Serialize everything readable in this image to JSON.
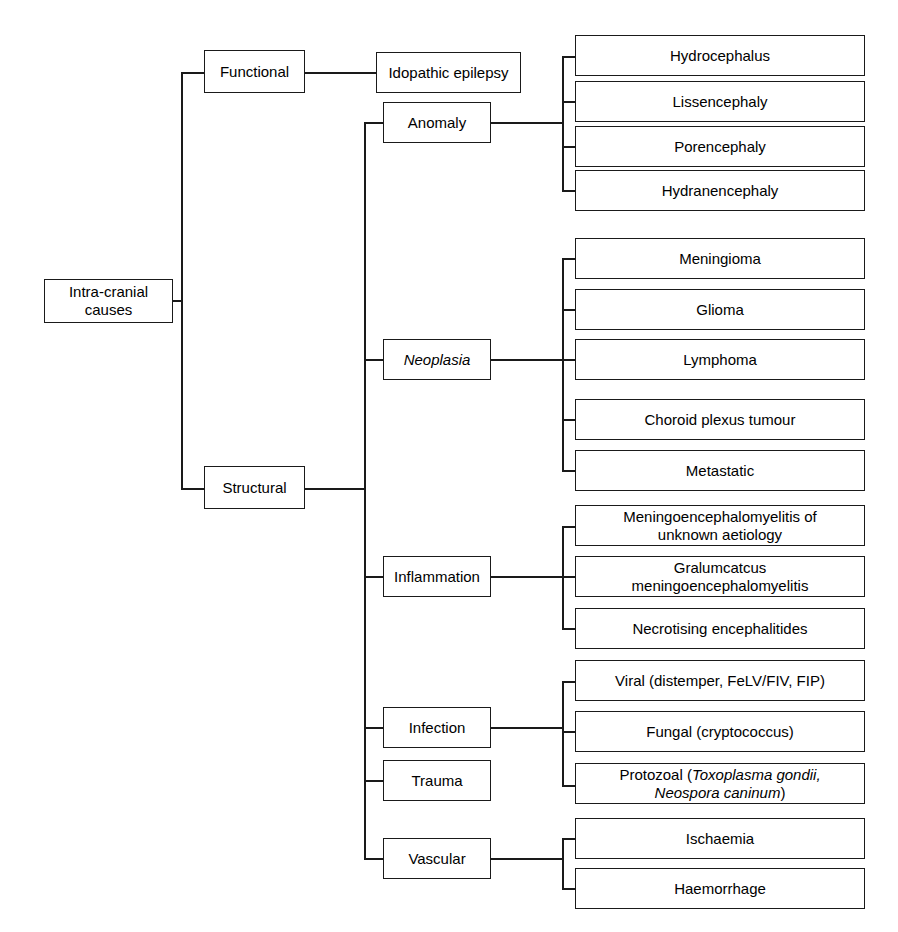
{
  "diagram": {
    "type": "hierarchical-flowchart",
    "orientation": "left-to-right",
    "line_color": "#1a1a1a",
    "box_fill": "#ffffff",
    "root": {
      "label": "Intra-cranial\ncauses"
    },
    "level1": [
      {
        "label": "Functional"
      },
      {
        "label": "Structural"
      }
    ],
    "level2": [
      {
        "label": "Idopathic epilepsy",
        "parent": "Functional",
        "italic": false
      },
      {
        "label": "Anomaly",
        "parent": "Structural",
        "italic": false
      },
      {
        "label": "Neoplasia",
        "parent": "Structural",
        "italic": true
      },
      {
        "label": "Inflammation",
        "parent": "Structural",
        "italic": false
      },
      {
        "label": "Infection",
        "parent": "Structural",
        "italic": false
      },
      {
        "label": "Trauma",
        "parent": "Structural",
        "italic": false
      },
      {
        "label": "Vascular",
        "parent": "Structural",
        "italic": false
      }
    ],
    "leaves": {
      "anomaly": [
        {
          "label": "Hydrocephalus"
        },
        {
          "label": "Lissencephaly"
        },
        {
          "label": "Porencephaly"
        },
        {
          "label": "Hydranencephaly"
        }
      ],
      "neoplasia": [
        {
          "label": "Meningioma"
        },
        {
          "label": "Glioma"
        },
        {
          "label": "Lymphoma"
        },
        {
          "label": "Choroid plexus tumour"
        },
        {
          "label": "Metastatic"
        }
      ],
      "inflammation": [
        {
          "label": "Meningoencephalomyelitis of\nunknown aetiology"
        },
        {
          "label": "Gralumcatcus\nmeningoencephalomyelitis"
        },
        {
          "label": "Necrotising encephalitides"
        }
      ],
      "infection": [
        {
          "label": "Viral (distemper, FeLV/FIV, FIP)"
        },
        {
          "label": "Fungal (cryptococcus)"
        },
        {
          "label_pre": "Protozoal (",
          "label_italic": "Toxoplasma gondii,\nNeospora caninum",
          "label_post": ")"
        }
      ],
      "vascular": [
        {
          "label": "Ischaemia"
        },
        {
          "label": "Haemorrhage"
        }
      ]
    }
  }
}
